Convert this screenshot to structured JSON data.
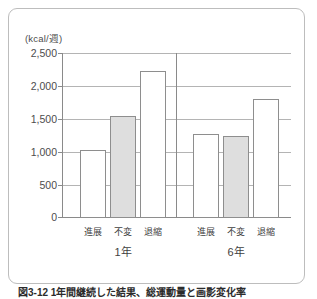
{
  "figure": {
    "caption": "図3-12 1年間継続した結果、総運動量と画影変化率"
  },
  "chart_data": {
    "type": "bar",
    "title": "",
    "xlabel": "",
    "ylabel": "(kcal/週)",
    "unit_label": "(kcal/週)",
    "ylim": [
      0,
      2500
    ],
    "yticks": [
      0,
      500,
      1000,
      1500,
      2000,
      2500
    ],
    "ytick_labels": [
      "0",
      "500",
      "1,000",
      "1,500",
      "2,000",
      "2,500"
    ],
    "grid": true,
    "legend": "none",
    "groups": [
      "1年",
      "6年"
    ],
    "categories": [
      "進展",
      "不変",
      "退縮"
    ],
    "series": [
      {
        "name": "1年",
        "values": [
          1030,
          1550,
          2230
        ]
      },
      {
        "name": "6年",
        "values": [
          1270,
          1250,
          1800
        ]
      }
    ],
    "bar_colors": {
      "進展": "#ffffff",
      "不変": "#dedede",
      "退縮": "#ffffff"
    },
    "bar_edge_color": "#8e8e8e",
    "grid_color": "#b4b4b4",
    "axis_color": "#8a8a8a"
  }
}
